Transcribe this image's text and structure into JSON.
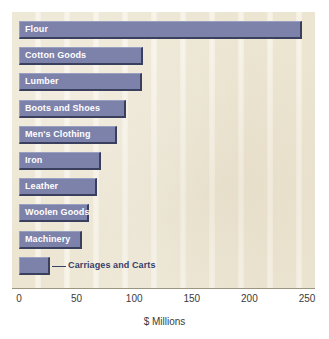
{
  "chart_data": {
    "type": "bar",
    "orientation": "horizontal",
    "title": "",
    "xlabel": "$ Millions",
    "ylabel": "",
    "xlim": [
      0,
      250
    ],
    "xticks": [
      0,
      50,
      100,
      150,
      200,
      250
    ],
    "xtick_labels": [
      "0",
      "50",
      "100",
      "150",
      "200",
      "250"
    ],
    "grid": true,
    "grid_axis": "x",
    "legend": null,
    "categories": [
      "Flour",
      "Cotton Goods",
      "Lumber",
      "Boots and Shoes",
      "Men's Clothing",
      "Iron",
      "Leather",
      "Woolen Goods",
      "Machinery",
      "Carriages and Carts"
    ],
    "values": [
      246,
      108,
      107,
      93,
      85,
      71,
      68,
      61,
      55,
      27
    ],
    "label_placement": [
      "inside",
      "inside",
      "inside",
      "inside",
      "inside",
      "inside",
      "inside",
      "inside",
      "inside",
      "outside"
    ]
  },
  "style": {
    "bar_fill": "#7d82ab",
    "bar_shadow": "#3b3f5e",
    "plot_background": "#ece5d2",
    "gridline_color": "#f8f4ea",
    "inside_label_color": "#ffffff",
    "outside_label_color": "#35406b",
    "axis_text_color": "#3b3b3b"
  }
}
